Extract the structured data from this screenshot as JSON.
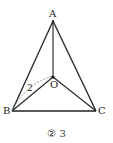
{
  "diagram": {
    "points": {
      "A": {
        "label": "A",
        "x": 53,
        "y": 21
      },
      "B": {
        "label": "B",
        "x": 12,
        "y": 111
      },
      "C": {
        "label": "C",
        "x": 96,
        "y": 111
      },
      "O": {
        "label": "O",
        "x": 53,
        "y": 77
      }
    },
    "segments": [
      {
        "from": "A",
        "to": "B",
        "style": "solid"
      },
      {
        "from": "A",
        "to": "C",
        "style": "solid"
      },
      {
        "from": "B",
        "to": "C",
        "style": "solid"
      },
      {
        "from": "A",
        "to": "O",
        "style": "solid"
      },
      {
        "from": "B",
        "to": "O",
        "style": "solid"
      },
      {
        "from": "C",
        "to": "O",
        "style": "solid"
      },
      {
        "from": "B",
        "to": "O",
        "style": "dashed",
        "label": "2"
      }
    ],
    "dashed_label": "2",
    "caption": "② 3"
  }
}
